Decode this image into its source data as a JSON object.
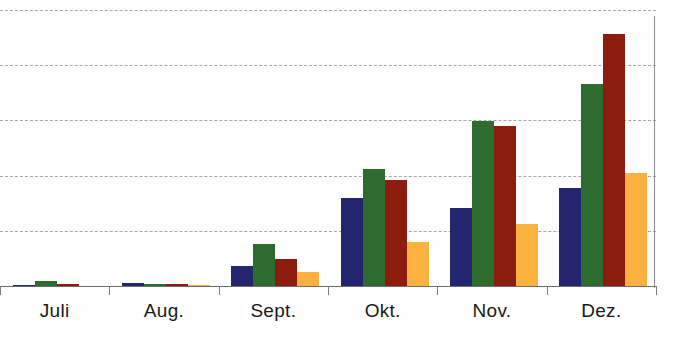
{
  "chart_data": {
    "type": "bar",
    "title": "",
    "subtitle": "",
    "xlabel": "",
    "ylabel": "",
    "categories": [
      "Juli",
      "Aug.",
      "Sept.",
      "Okt.",
      "Nov.",
      "Dez."
    ],
    "series": [
      {
        "name": "series-1",
        "color": "#23256f",
        "values": [
          1,
          3,
          20,
          86,
          76,
          96
        ]
      },
      {
        "name": "series-2",
        "color": "#2e6b2f",
        "values": [
          5,
          2,
          41,
          114,
          161,
          198
        ]
      },
      {
        "name": "series-3",
        "color": "#8c1c0d",
        "values": [
          2,
          2,
          26,
          104,
          157,
          247
        ]
      },
      {
        "name": "series-4",
        "color": "#fbb040",
        "values": [
          0,
          1,
          14,
          43,
          61,
          111
        ]
      }
    ],
    "ylim": [
      0,
      270
    ],
    "y_gridlines": [
      54,
      108,
      162,
      216,
      270
    ],
    "grid": true,
    "grid_style": "dashed",
    "legend": "none",
    "axis_lines": [
      "bottom",
      "right"
    ],
    "tick_labels_y": []
  },
  "axis": {
    "category_labels": [
      "Juli",
      "Aug.",
      "Sept.",
      "Okt.",
      "Nov.",
      "Dez."
    ]
  }
}
